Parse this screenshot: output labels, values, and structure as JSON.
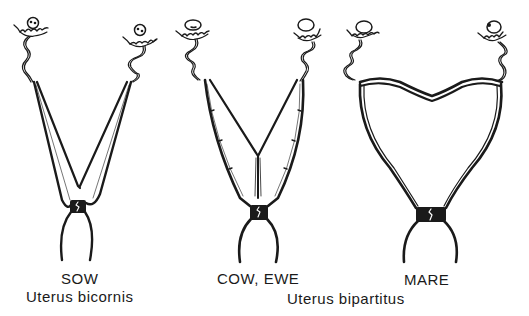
{
  "diagram": {
    "colors": {
      "ink": "#1a1a1a",
      "background": "#ffffff"
    },
    "specimens": [
      {
        "name": "SOW",
        "type": "Uterus bicornis"
      },
      {
        "name": "COW, EWE",
        "type": "Uterus bipartitus"
      },
      {
        "name": "MARE",
        "type": "Uterus bipartitus"
      }
    ],
    "labels": {
      "sow": "SOW",
      "sow_type": "Uterus bicornis",
      "cow_ewe": "COW, EWE",
      "mare": "MARE",
      "bipartitus_type": "Uterus bipartitus"
    }
  }
}
